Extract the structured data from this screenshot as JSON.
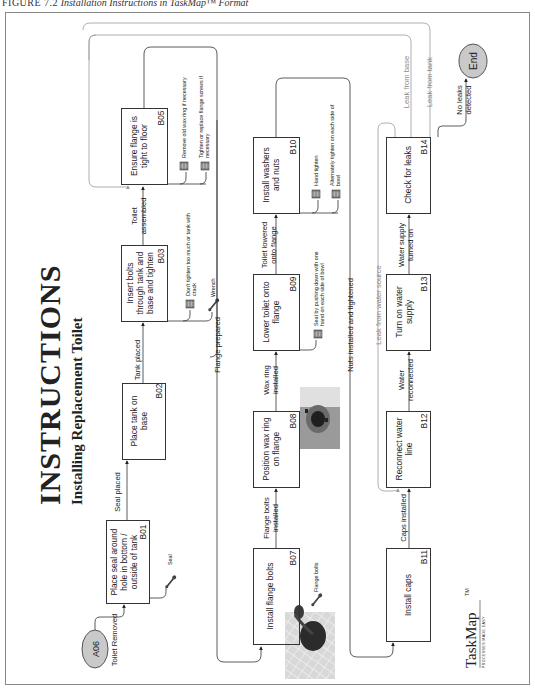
{
  "figure_caption": {
    "label": "FIGURE 7.2",
    "text": "Installation Instructions in TaskMap™ Format"
  },
  "header": {
    "title": "INSTRUCTIONS",
    "subtitle": "Installing Replacement Toilet"
  },
  "logo": {
    "name": "TaskMap",
    "trademark": "TM",
    "tagline": "PROCESSES MADE EASY"
  },
  "terminals": {
    "start": "A06",
    "end": "End"
  },
  "steps": [
    {
      "id": "B01",
      "lines": [
        "Place seal around",
        "hole in bottom /",
        "outside of tank"
      ]
    },
    {
      "id": "B02",
      "lines": [
        "Place tank on",
        "base"
      ]
    },
    {
      "id": "B03",
      "lines": [
        "Insert bolts",
        "through tank and",
        "base and tighten"
      ]
    },
    {
      "id": "B05",
      "lines": [
        "Ensure flange is",
        "tight to floor"
      ]
    },
    {
      "id": "B07",
      "lines": [
        "Install flange bolts"
      ]
    },
    {
      "id": "B08",
      "lines": [
        "Position wax ring",
        "on flange"
      ]
    },
    {
      "id": "B09",
      "lines": [
        "Lower toilet onto",
        "flange"
      ]
    },
    {
      "id": "B10",
      "lines": [
        "Install washers",
        "and nuts"
      ]
    },
    {
      "id": "B11",
      "lines": [
        "Install caps"
      ]
    },
    {
      "id": "B12",
      "lines": [
        "Reconnect water",
        "line"
      ]
    },
    {
      "id": "B13",
      "lines": [
        "Turn on water",
        "supply"
      ]
    },
    {
      "id": "B14",
      "lines": [
        "Check for leaks"
      ]
    }
  ],
  "connectors": {
    "toilet_removed": [
      "Toilet Removed"
    ],
    "seal_placed": [
      "Seal placed"
    ],
    "tank_placed": [
      "Tank placed"
    ],
    "toilet_assembled": [
      "Toilet",
      "assembled"
    ],
    "flange_prepared": [
      "Flange prepared"
    ],
    "flange_bolts_installed": [
      "Flange bolts",
      "installed"
    ],
    "wax_ring_installed": [
      "Wax ring",
      "installed"
    ],
    "toilet_lowered": [
      "Toilet lowered",
      "onto flange"
    ],
    "nuts_installed": [
      "Nuts installed and tightened"
    ],
    "caps_installed": [
      "Caps installed"
    ],
    "water_reconnected": [
      "Water",
      "reconnected"
    ],
    "water_supply_on": [
      "Water supply",
      "turned on"
    ],
    "no_leaks": [
      "No leaks",
      "detected"
    ],
    "leak_from_water_source": [
      "Leak from water source"
    ],
    "leak_from_base": [
      "Leak from base"
    ],
    "leak_from_tank": [
      "Leak from tank"
    ]
  },
  "annotations": {
    "b01_tool": {
      "type": "tool",
      "icon": "wrench-icon",
      "text": "Seal"
    },
    "b03_note": {
      "type": "note",
      "icon": "note-icon",
      "lines": [
        "Don't tighten too much or tank with",
        "crack"
      ]
    },
    "b03_tool": {
      "type": "tool",
      "icon": "wrench-icon",
      "text": "Wrench"
    },
    "b05_note1": {
      "type": "note",
      "icon": "note-icon",
      "lines": [
        "Remove old wax ring if necessary"
      ]
    },
    "b05_note2": {
      "type": "note",
      "icon": "note-icon",
      "lines": [
        "Tighten or replace flange screws if",
        "necessary"
      ]
    },
    "b07_tool": {
      "type": "tool",
      "icon": "wrench-icon",
      "text": "Flange bolts"
    },
    "b09_note": {
      "type": "note",
      "icon": "note-icon",
      "lines": [
        "Seat by pushing down with one",
        "hand on each side of bowl"
      ]
    },
    "b10_note1": {
      "type": "note",
      "icon": "note-icon",
      "lines": [
        "Hand tighten"
      ]
    },
    "b10_note2": {
      "type": "note",
      "icon": "note-icon",
      "lines": [
        "Alternately tighten on each side of",
        "bowl"
      ]
    }
  },
  "photos": {
    "b07": "photo of flange with bolts",
    "b08": "photo of wax ring on flange"
  },
  "colors": {
    "line": "#333333",
    "feedback_line": "#9a9a9a",
    "terminal_fill": "#c9c9c9",
    "frame": "#888888"
  }
}
